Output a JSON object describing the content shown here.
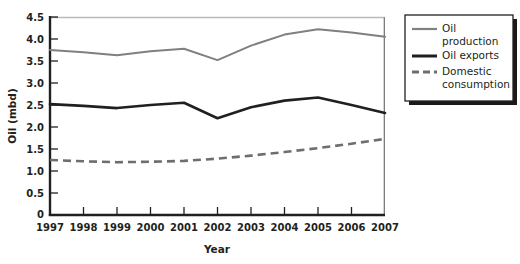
{
  "chart_data": {
    "type": "line",
    "title": "",
    "xlabel": "Year",
    "ylabel": "Oil (mbd)",
    "categories": [
      "1997",
      "1998",
      "1999",
      "2000",
      "2001",
      "2002",
      "2003",
      "2004",
      "2005",
      "2006",
      "2007"
    ],
    "x": [
      1997,
      1998,
      1999,
      2000,
      2001,
      2002,
      2003,
      2004,
      2005,
      2006,
      2007
    ],
    "xlim": [
      1997,
      2007
    ],
    "ylim": [
      0,
      4.5
    ],
    "yticks": [
      "0",
      "0.5",
      "1.0",
      "1.5",
      "2.0",
      "2.5",
      "3.0",
      "3.5",
      "4.0",
      "4.5"
    ],
    "ytick_values": [
      0,
      0.5,
      1.0,
      1.5,
      2.0,
      2.5,
      3.0,
      3.5,
      4.0,
      4.5
    ],
    "grid": false,
    "legend_position": "right",
    "series": [
      {
        "name": "Oil production",
        "label_lines": [
          "Oil",
          "production"
        ],
        "style": "solid",
        "color": "#808080",
        "width": 2.0,
        "values": [
          3.75,
          3.7,
          3.63,
          3.72,
          3.78,
          3.52,
          3.85,
          4.1,
          4.22,
          4.15,
          4.05
        ]
      },
      {
        "name": "Oil exports",
        "label_lines": [
          "Oil exports"
        ],
        "style": "solid",
        "color": "#231f20",
        "width": 2.6,
        "values": [
          2.52,
          2.48,
          2.43,
          2.5,
          2.55,
          2.2,
          2.45,
          2.6,
          2.67,
          2.5,
          2.32
        ]
      },
      {
        "name": "Domestic consumption",
        "label_lines": [
          "Domestic",
          "consumption"
        ],
        "style": "dashed",
        "color": "#6d6e71",
        "width": 2.6,
        "values": [
          1.25,
          1.22,
          1.2,
          1.21,
          1.23,
          1.28,
          1.35,
          1.43,
          1.52,
          1.62,
          1.73
        ]
      }
    ]
  },
  "axes": {
    "y_title": "Oil (mbd)",
    "x_title": "Year",
    "ytick_labels": [
      "4.5",
      "4.0",
      "3.5",
      "3.0",
      "2.5",
      "2.0",
      "1.5",
      "1.0",
      "0.5",
      "0"
    ],
    "xtick_labels": [
      "1997",
      "1998",
      "1999",
      "2000",
      "2001",
      "2002",
      "2003",
      "2004",
      "2005",
      "2006",
      "2007"
    ]
  },
  "legend": {
    "entries": [
      {
        "label": "Oil production",
        "line1": "Oil",
        "line2": "production",
        "swatch": "solid-gray-line"
      },
      {
        "label": "Oil exports",
        "line1": "Oil exports",
        "line2": "",
        "swatch": "solid-black-line"
      },
      {
        "label": "Domestic consumption",
        "line1": "Domestic",
        "line2": "consumption",
        "swatch": "dashed-gray-line"
      }
    ]
  },
  "colors": {
    "production": "#808080",
    "exports": "#231f20",
    "consumption": "#6d6e71",
    "axis": "#231f20",
    "frame": "#b9babc",
    "shadow": "#000000",
    "background": "#ffffff"
  }
}
